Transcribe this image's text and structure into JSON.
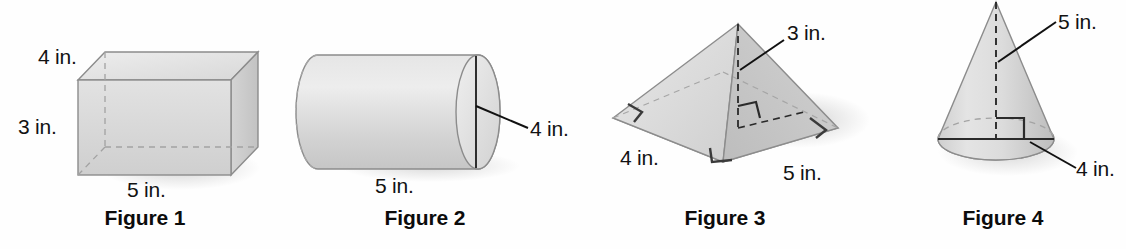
{
  "page": {
    "background_color": "#fefefe",
    "text_color": "#121212",
    "solid_fill": "#d9d9d9",
    "solid_stroke": "#7a7a7a",
    "leader_color": "#111111"
  },
  "figures": [
    {
      "id": "figure-1",
      "caption": "Figure 1",
      "shape": "rectangular-prism",
      "labels": [
        {
          "name": "depth-label",
          "text": "4 in."
        },
        {
          "name": "height-label",
          "text": "3 in."
        },
        {
          "name": "width-label",
          "text": "5 in."
        }
      ]
    },
    {
      "id": "figure-2",
      "caption": "Figure 2",
      "shape": "cylinder",
      "labels": [
        {
          "name": "length-label",
          "text": "5 in."
        },
        {
          "name": "diameter-label",
          "text": "4 in."
        }
      ]
    },
    {
      "id": "figure-3",
      "caption": "Figure 3",
      "shape": "rectangular-pyramid",
      "labels": [
        {
          "name": "height-label",
          "text": "3 in."
        },
        {
          "name": "base-width-label",
          "text": "4 in."
        },
        {
          "name": "base-length-label",
          "text": "5 in."
        }
      ]
    },
    {
      "id": "figure-4",
      "caption": "Figure 4",
      "shape": "cone",
      "labels": [
        {
          "name": "height-label",
          "text": "5 in."
        },
        {
          "name": "diameter-label",
          "text": "4 in."
        }
      ]
    }
  ]
}
